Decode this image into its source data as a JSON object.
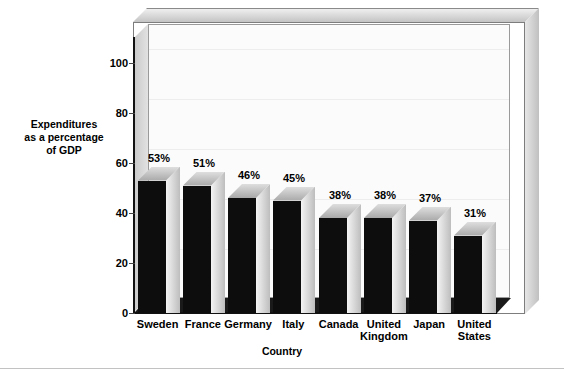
{
  "page": {
    "header_remnant": "· ·  ·   ·      ·     ·   ·   ·"
  },
  "chart_data": {
    "type": "bar",
    "title": "",
    "subtitle": "",
    "xlabel": "Country",
    "ylabel": "Expenditures as a percentage of GDP",
    "ylabel_lines": [
      "Expenditures",
      "as a percentage",
      "of GDP"
    ],
    "categories": [
      "Sweden",
      "France",
      "Germany",
      "Italy",
      "Canada",
      "United Kingdom",
      "Japan",
      "United States"
    ],
    "category_lines": [
      [
        "Sweden"
      ],
      [
        "France"
      ],
      [
        "Germany"
      ],
      [
        "Italy"
      ],
      [
        "Canada"
      ],
      [
        "United",
        "Kingdom"
      ],
      [
        "Japan"
      ],
      [
        "United",
        "States"
      ]
    ],
    "values": [
      53,
      51,
      46,
      45,
      38,
      38,
      37,
      31
    ],
    "data_labels": [
      "53%",
      "51%",
      "46%",
      "45%",
      "38%",
      "38%",
      "37%",
      "31%"
    ],
    "ylim": [
      0,
      110
    ],
    "yticks": [
      0,
      20,
      40,
      60,
      80,
      100
    ],
    "ytick_labels": [
      "0",
      "20",
      "40",
      "60",
      "80",
      "100"
    ],
    "grid": true,
    "legend": "none",
    "style": "3d-column",
    "colors": {
      "bar_front": "#0d0d0d",
      "bar_top": "#c8c8c8",
      "bar_side": "#e0e0e0",
      "plot_background": "#fbfbfb",
      "frame": "#d0d0d0",
      "floor": "#1a1a1a",
      "text": "#000000"
    }
  }
}
